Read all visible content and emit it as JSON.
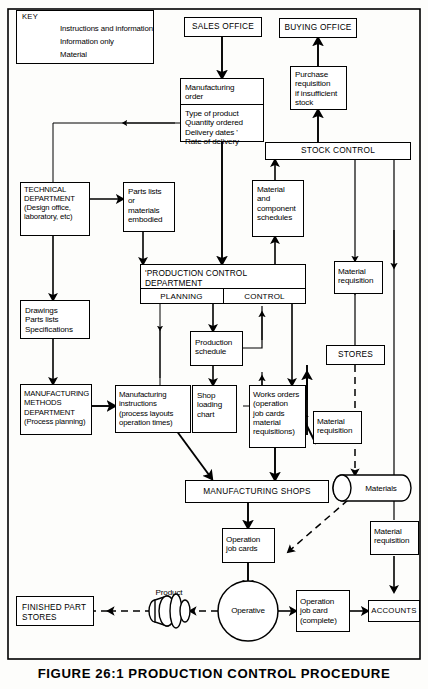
{
  "figure": {
    "caption": "FIGURE 26:1   PRODUCTION CONTROL PROCEDURE"
  },
  "key": {
    "title": "KEY",
    "items": [
      {
        "label": "Instructions and information",
        "style": "thick-solid"
      },
      {
        "label": "Information only",
        "style": "thin-solid"
      },
      {
        "label": "Material",
        "style": "dashed"
      }
    ]
  },
  "nodes": {
    "sales_office": "SALES OFFICE",
    "buying_office": "BUYING OFFICE",
    "manufacturing_order_title": "Manufacturing\norder",
    "manufacturing_order_details": "Type of product\nQuantity ordered\nDelivery dates '\nRate of delivery",
    "purchase_requisition": "Purchase\nrequisition\nif insufficient\nstock",
    "stock_control": "STOCK CONTROL",
    "technical_department": "TECHNICAL\nDEPARTMENT\n(Design office,\nlaboratory, etc)",
    "parts_lists_embodied": "Parts lists\nor\nmaterials\nembodied",
    "material_component_schedules": "Material\nand\ncomponent\nschedules",
    "material_requisition_right_top": "Material\nrequisition",
    "drawings_parts_specs": "Drawings\nParts lists\nSpecifications",
    "production_control_dept": "'PRODUCTION  CONTROL\n    DEPARTMENT",
    "planning": "PLANNING",
    "control": "CONTROL",
    "production_schedule": "Production\nschedule",
    "stores": "STORES",
    "manufacturing_methods_dept": "MANUFACTURING\nMETHODS\nDEPARTMENT\n(Process planning)",
    "manufacturing_instructions": "Manufacturing\ninstructions\n(process layouts\noperation times)",
    "shop_loading_chart": "Shop\nloading\nchart",
    "works_orders": "Works orders\n(operation\njob cards\nmaterial\nrequisitions)",
    "material_requisition_mid": "Material\nrequisition",
    "manufacturing_shops": "MANUFACTURING SHOPS",
    "materials": "Materials",
    "operation_job_cards": "Operation\njob cards",
    "material_requisition_bottom": "Material\nrequisition",
    "finished_part_stores": "FINISHED PART\nSTORES",
    "product_label": "Product",
    "operative": "Operative",
    "operation_job_card_complete": "Operation\njob card\n(complete)",
    "accounts": "ACCOUNTS"
  },
  "colors": {
    "ink": "#000000",
    "paper": "#fdfdfb"
  }
}
